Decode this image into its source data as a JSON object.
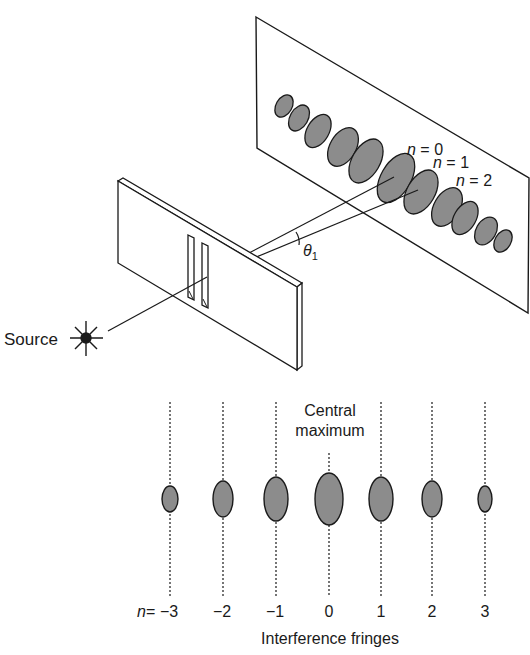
{
  "figure": {
    "colors": {
      "ink": "#1a1a1a",
      "fringe_fill": "#8c8c8c",
      "background": "#ffffff"
    }
  },
  "top_diagram": {
    "source_label": "Source",
    "source_icon": "star-burst-icon",
    "angle_label": "θ",
    "angle_subscript": "1",
    "order_labels": [
      {
        "n_prefix": "n",
        "equals": " = ",
        "value": "0"
      },
      {
        "n_prefix": "n",
        "equals": " = ",
        "value": "1"
      },
      {
        "n_prefix": "n",
        "equals": " = ",
        "value": "2"
      }
    ],
    "screen_fringe_count": 13
  },
  "bottom_diagram": {
    "central_label_line1": "Central",
    "central_label_line2": "maximum",
    "n_prefix": "n",
    "equals": " = ",
    "orders": [
      "−3",
      "−2",
      "−1",
      "0",
      "1",
      "2",
      "3"
    ],
    "caption": "Interference fringes"
  }
}
